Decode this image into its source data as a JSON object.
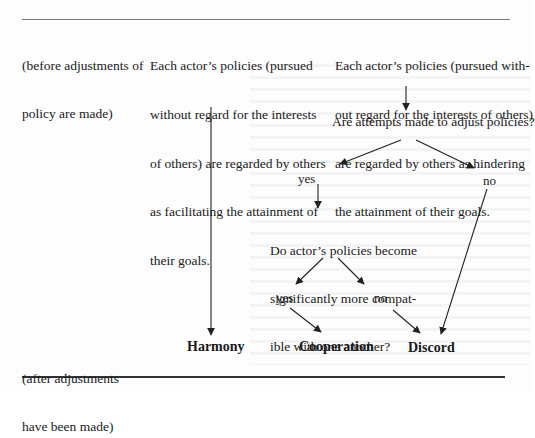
{
  "diagram": {
    "side_labels": {
      "before": [
        "(before adjustments of",
        "policy are made)"
      ],
      "after": [
        "(after adjustments",
        "have been made)"
      ]
    },
    "boxes": {
      "facilitating": [
        "Each actor’s policies (pursued",
        "without regard for the interests",
        "of others) are regarded by others",
        "as facilitating the attainment of",
        "their goals."
      ],
      "hindering": [
        "Each actor’s policies (pursued with-",
        "out regard for the interests of others)",
        "are regarded by others as hindering",
        "the attainment of their goals."
      ]
    },
    "questions": {
      "adjust": "Are attempts made to adjust policies?",
      "compatible": [
        "Do actor’s policies become",
        "significantly more compat-",
        "ible with one another?"
      ]
    },
    "answers": {
      "adjust_yes": "yes",
      "adjust_no": "no",
      "compatible_yes": "yes",
      "compatible_no": "no"
    },
    "outcomes": {
      "harmony": "Harmony",
      "cooperation": "Cooperation",
      "discord": "Discord"
    },
    "colors": {
      "text": "#1a1a1a",
      "arrow": "#222222",
      "rule": "#333333",
      "background": "#fdfdfd"
    }
  }
}
